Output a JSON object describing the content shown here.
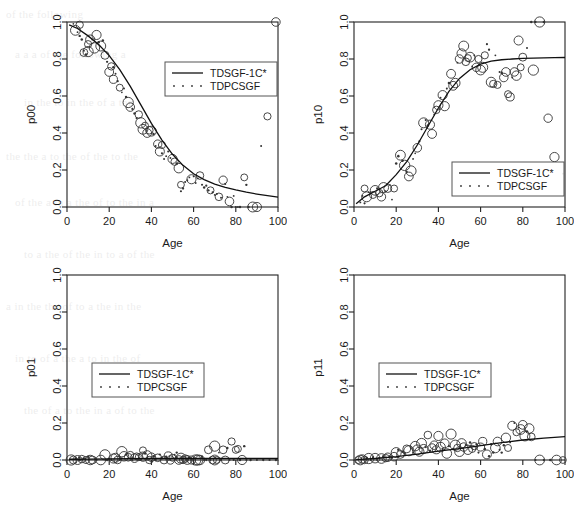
{
  "figure": {
    "background_color": "#ffffff",
    "ink_color": "#1a1a1a",
    "panel_count": 4,
    "layout": "2x2 grid"
  },
  "legend": {
    "series_line_label": "TDSGF-1C*",
    "series_dot_label": "TDPCSGF"
  },
  "background_text": [
    "of the following",
    "a a a of the following a",
    "in the to in the of a the",
    "the the a to the of the to the",
    "of the a in a the of to the in a",
    "to a the of the in to a of the",
    "a in the the of to a the in the",
    "in to of a the a to in the of",
    "the of a to the in a of to the"
  ],
  "chart_data": [
    {
      "type": "scatter",
      "panel": "top-left",
      "title": "",
      "xlabel": "Age",
      "ylabel": "p00",
      "xlim": [
        0,
        100
      ],
      "ylim": [
        0,
        1
      ],
      "xticks": [
        0,
        20,
        40,
        60,
        80,
        100
      ],
      "yticks": [
        "0.0",
        "0.2",
        "0.4",
        "0.6",
        "0.8",
        "1.0"
      ],
      "grid": false,
      "legend_position": "top-right-inside",
      "series": [
        {
          "name": "TDSGF-1C*",
          "style": "line",
          "x": [
            1,
            5,
            10,
            15,
            20,
            25,
            30,
            35,
            40,
            45,
            50,
            55,
            60,
            65,
            70,
            75,
            80,
            85,
            90,
            95,
            100
          ],
          "y": [
            0.985,
            0.965,
            0.925,
            0.878,
            0.818,
            0.742,
            0.652,
            0.552,
            0.452,
            0.362,
            0.285,
            0.225,
            0.18,
            0.148,
            0.124,
            0.106,
            0.092,
            0.08,
            0.07,
            0.061,
            0.053
          ]
        },
        {
          "name": "TDPCSGF",
          "style": "points",
          "x": [
            3,
            4,
            5,
            6,
            6,
            7,
            8,
            8,
            9,
            10,
            10,
            11,
            12,
            13,
            14,
            15,
            16,
            17,
            18,
            19,
            20,
            21,
            22,
            22,
            23,
            24,
            25,
            26,
            27,
            28,
            29,
            30,
            31,
            32,
            33,
            34,
            35,
            36,
            37,
            38,
            39,
            40,
            41,
            42,
            43,
            44,
            45,
            45,
            46,
            47,
            48,
            49,
            50,
            51,
            52,
            53,
            54,
            54,
            55,
            56,
            57,
            58,
            59,
            60,
            61,
            62,
            63,
            64,
            65,
            66,
            67,
            68,
            69,
            70,
            71,
            72,
            73,
            74,
            75,
            76,
            77,
            78,
            79,
            80,
            81,
            82,
            84,
            85,
            86,
            88,
            90,
            92,
            95,
            99
          ],
          "y": [
            0.99,
            0.955,
            0.945,
            0.985,
            0.925,
            0.905,
            0.835,
            0.845,
            0.825,
            0.88,
            0.84,
            0.905,
            0.905,
            0.86,
            0.93,
            0.89,
            0.87,
            0.9,
            0.82,
            0.785,
            0.73,
            0.76,
            0.69,
            0.755,
            0.72,
            0.68,
            0.645,
            0.62,
            0.64,
            0.595,
            0.565,
            0.54,
            0.53,
            0.505,
            0.48,
            0.5,
            0.455,
            0.42,
            0.44,
            0.4,
            0.415,
            0.41,
            0.395,
            0.33,
            0.34,
            0.3,
            0.29,
            0.335,
            0.26,
            0.275,
            0.3,
            0.265,
            0.26,
            0.245,
            0.235,
            0.21,
            0.12,
            0.085,
            0.1,
            0.135,
            0.145,
            0.16,
            0.15,
            0.165,
            0.13,
            0.155,
            0.17,
            0.12,
            0.105,
            0.115,
            0.09,
            0.09,
            0.08,
            0.065,
            0.07,
            0.055,
            0.05,
            0.145,
            0.125,
            0.055,
            0.03,
            0.0,
            0.06,
            0.0,
            0.0,
            0.0,
            0.16,
            0.12,
            0.0,
            0.0,
            0.0,
            0.33,
            0.49,
            1.0
          ]
        }
      ]
    },
    {
      "type": "scatter",
      "panel": "top-right",
      "title": "",
      "xlabel": "Age",
      "ylabel": "p10",
      "xlim": [
        0,
        100
      ],
      "ylim": [
        0,
        1
      ],
      "xticks": [
        0,
        20,
        40,
        60,
        80,
        100
      ],
      "yticks": [
        "0.0",
        "0.2",
        "0.4",
        "0.6",
        "0.8",
        "1.0"
      ],
      "grid": false,
      "legend_position": "center-right-inside",
      "series": [
        {
          "name": "TDSGF-1C*",
          "style": "line",
          "x": [
            1,
            5,
            10,
            15,
            20,
            25,
            30,
            35,
            40,
            45,
            50,
            55,
            60,
            65,
            70,
            75,
            80,
            85,
            90,
            95,
            100
          ],
          "y": [
            0.018,
            0.055,
            0.085,
            0.115,
            0.175,
            0.245,
            0.335,
            0.435,
            0.535,
            0.625,
            0.695,
            0.742,
            0.772,
            0.788,
            0.796,
            0.8,
            0.803,
            0.805,
            0.806,
            0.807,
            0.808
          ]
        },
        {
          "name": "TDPCSGF",
          "style": "points",
          "x": [
            3,
            4,
            5,
            5,
            6,
            7,
            8,
            9,
            10,
            11,
            12,
            13,
            14,
            15,
            16,
            17,
            18,
            19,
            20,
            21,
            22,
            23,
            24,
            25,
            26,
            27,
            28,
            29,
            30,
            31,
            32,
            33,
            34,
            35,
            36,
            37,
            38,
            39,
            40,
            41,
            42,
            43,
            44,
            45,
            46,
            47,
            48,
            49,
            50,
            51,
            52,
            53,
            54,
            55,
            56,
            57,
            58,
            59,
            60,
            61,
            62,
            63,
            64,
            65,
            66,
            67,
            68,
            69,
            70,
            71,
            72,
            73,
            74,
            75,
            76,
            77,
            78,
            79,
            80,
            82,
            84,
            85,
            86,
            88,
            90,
            92,
            95,
            99
          ],
          "y": [
            0.025,
            0.06,
            0.1,
            0.02,
            0.055,
            0.08,
            0.075,
            0.065,
            0.09,
            0.1,
            0.075,
            0.055,
            0.105,
            0.085,
            0.1,
            0.12,
            0.04,
            0.1,
            0.235,
            0.275,
            0.28,
            0.25,
            0.225,
            0.19,
            0.165,
            0.195,
            0.26,
            0.29,
            0.32,
            0.355,
            0.42,
            0.455,
            0.47,
            0.44,
            0.445,
            0.395,
            0.5,
            0.525,
            0.55,
            0.59,
            0.605,
            0.545,
            0.64,
            0.67,
            0.72,
            0.655,
            0.67,
            0.78,
            0.8,
            0.83,
            0.87,
            0.785,
            0.805,
            0.81,
            0.76,
            0.82,
            0.755,
            0.8,
            0.74,
            0.755,
            0.82,
            0.88,
            0.85,
            0.675,
            0.665,
            0.82,
            0.66,
            0.73,
            0.725,
            0.7,
            0.73,
            0.61,
            0.595,
            0.7,
            0.73,
            0.71,
            0.9,
            0.755,
            0.81,
            0.86,
            1.0,
            0.74,
            1.0,
            1.0,
            1.0,
            0.48,
            0.27,
            0.18
          ]
        }
      ]
    },
    {
      "type": "scatter",
      "panel": "bottom-left",
      "title": "",
      "xlabel": "Age",
      "ylabel": "p01",
      "xlim": [
        0,
        100
      ],
      "ylim": [
        0,
        1
      ],
      "xticks": [
        0,
        20,
        40,
        60,
        80,
        100
      ],
      "yticks": [
        "0.0",
        "0.2",
        "0.4",
        "0.6",
        "0.8",
        "1.0"
      ],
      "grid": false,
      "legend_position": "center-left-inside",
      "series": [
        {
          "name": "TDSGF-1C*",
          "style": "line",
          "x": [
            1,
            10,
            20,
            30,
            40,
            50,
            60,
            70,
            80,
            90,
            100
          ],
          "y": [
            0.004,
            0.005,
            0.006,
            0.007,
            0.008,
            0.008,
            0.008,
            0.008,
            0.008,
            0.008,
            0.008
          ]
        },
        {
          "name": "TDPCSGF",
          "style": "points",
          "x": [
            2,
            3,
            4,
            5,
            6,
            6,
            7,
            8,
            9,
            10,
            11,
            12,
            14,
            16,
            18,
            19,
            20,
            21,
            22,
            23,
            24,
            25,
            26,
            26,
            27,
            28,
            29,
            30,
            31,
            32,
            33,
            34,
            35,
            36,
            36,
            37,
            38,
            39,
            40,
            41,
            42,
            43,
            44,
            45,
            46,
            47,
            48,
            49,
            50,
            51,
            52,
            52,
            53,
            54,
            55,
            56,
            57,
            58,
            59,
            60,
            61,
            62,
            63,
            64,
            65,
            66,
            67,
            68,
            69,
            70,
            70,
            71,
            72,
            73,
            74,
            75,
            76,
            77,
            78,
            79,
            80,
            81,
            82,
            83,
            84,
            85,
            87,
            90,
            93,
            96,
            99
          ],
          "y": [
            0.0,
            0.0,
            0.005,
            0.0,
            0.012,
            0.0,
            0.005,
            0.008,
            0.0,
            0.018,
            0.0,
            0.0,
            0.0,
            0.0,
            0.028,
            0.0,
            0.005,
            0.0,
            0.008,
            0.012,
            0.0,
            0.0,
            0.045,
            0.01,
            0.02,
            0.03,
            0.015,
            0.028,
            0.0,
            0.01,
            0.02,
            0.015,
            0.0,
            0.052,
            0.018,
            0.035,
            0.025,
            0.0,
            0.015,
            0.02,
            0.0,
            0.012,
            0.03,
            0.01,
            0.0,
            0.018,
            0.022,
            0.0,
            0.012,
            0.028,
            0.04,
            0.015,
            0.0,
            0.01,
            0.0,
            0.008,
            0.0,
            0.012,
            0.0,
            0.005,
            0.0,
            0.0,
            0.0,
            0.018,
            0.0,
            0.0,
            0.055,
            0.0,
            0.0,
            0.075,
            0.0,
            0.0,
            0.04,
            0.0,
            0.055,
            0.0,
            0.065,
            0.0,
            0.1,
            0.0,
            0.055,
            0.06,
            0.0,
            0.0,
            0.075,
            0.0,
            0.0,
            0.0,
            0.0,
            0.0,
            0.0
          ]
        }
      ]
    },
    {
      "type": "scatter",
      "panel": "bottom-right",
      "title": "",
      "xlabel": "Age",
      "ylabel": "p11",
      "xlim": [
        0,
        100
      ],
      "ylim": [
        0,
        1
      ],
      "xticks": [
        0,
        20,
        40,
        60,
        80,
        100
      ],
      "yticks": [
        "0.0",
        "0.2",
        "0.4",
        "0.6",
        "0.8",
        "1.0"
      ],
      "grid": false,
      "legend_position": "center-left-inside",
      "series": [
        {
          "name": "TDSGF-1C*",
          "style": "line",
          "x": [
            1,
            10,
            20,
            30,
            40,
            50,
            60,
            70,
            80,
            90,
            100
          ],
          "y": [
            0.002,
            0.008,
            0.018,
            0.032,
            0.048,
            0.062,
            0.078,
            0.094,
            0.108,
            0.118,
            0.126
          ]
        },
        {
          "name": "TDPCSGF",
          "style": "points",
          "x": [
            2,
            3,
            4,
            5,
            6,
            7,
            8,
            9,
            10,
            11,
            12,
            13,
            14,
            15,
            16,
            17,
            18,
            19,
            20,
            21,
            22,
            23,
            24,
            25,
            26,
            27,
            28,
            29,
            30,
            31,
            32,
            33,
            34,
            35,
            36,
            37,
            38,
            39,
            40,
            41,
            42,
            43,
            44,
            45,
            46,
            47,
            48,
            49,
            50,
            51,
            52,
            53,
            54,
            55,
            56,
            57,
            58,
            59,
            60,
            61,
            62,
            63,
            64,
            65,
            66,
            67,
            68,
            69,
            70,
            71,
            72,
            73,
            74,
            75,
            76,
            77,
            78,
            79,
            80,
            81,
            82,
            83,
            84,
            86,
            88,
            90,
            93,
            96,
            99
          ],
          "y": [
            0.0,
            0.0,
            0.005,
            0.0,
            0.012,
            0.008,
            0.0,
            0.015,
            0.01,
            0.0,
            0.012,
            0.008,
            0.018,
            0.01,
            0.015,
            0.02,
            0.012,
            0.018,
            0.04,
            0.055,
            0.03,
            0.045,
            0.035,
            0.06,
            0.05,
            0.065,
            0.04,
            0.075,
            0.055,
            0.045,
            0.09,
            0.06,
            0.07,
            0.135,
            0.05,
            0.065,
            0.08,
            0.055,
            0.13,
            0.07,
            0.06,
            0.09,
            0.035,
            0.075,
            0.14,
            0.06,
            0.08,
            0.065,
            0.045,
            0.09,
            0.07,
            0.08,
            0.055,
            0.095,
            0.06,
            0.075,
            0.085,
            0.04,
            0.07,
            0.1,
            0.06,
            0.03,
            0.02,
            0.085,
            0.04,
            0.065,
            0.1,
            0.055,
            0.04,
            0.08,
            0.12,
            0.065,
            0.095,
            0.185,
            0.2,
            0.15,
            0.175,
            0.165,
            0.19,
            0.13,
            0.155,
            0.17,
            0.125,
            0.0,
            0.0,
            0.0,
            0.0,
            0.0,
            0.0
          ]
        }
      ]
    }
  ]
}
